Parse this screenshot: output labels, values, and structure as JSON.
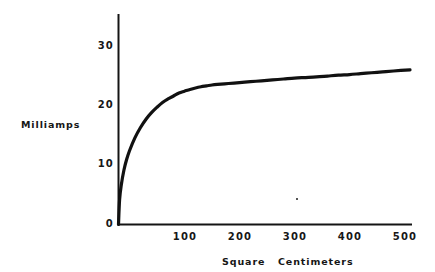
{
  "figure": {
    "background_color": "#ffffff",
    "line_color": "#111111"
  },
  "axes": {
    "y_label": "Milliamps",
    "x_label": "Square   Centimeters",
    "y_ticks": [
      "0",
      "10",
      "20",
      "30"
    ],
    "x_ticks": [
      "100",
      "200",
      "300",
      "400",
      "500"
    ]
  },
  "chart_data": {
    "type": "line",
    "title": "",
    "xlabel": "Square   Centimeters",
    "ylabel": "Milliamps",
    "xlim": [
      0,
      535
    ],
    "ylim": [
      0,
      35
    ],
    "xticks": [
      100,
      200,
      300,
      400,
      500
    ],
    "yticks": [
      0,
      10,
      20,
      30
    ],
    "grid": false,
    "legend": null,
    "series": [
      {
        "name": "current vs area",
        "x": [
          0,
          2,
          5,
          10,
          15,
          20,
          30,
          40,
          50,
          60,
          70,
          80,
          90,
          100,
          110,
          120,
          130,
          140,
          150,
          160,
          170,
          180,
          200,
          220,
          240,
          260,
          280,
          300,
          320,
          340,
          360,
          380,
          400,
          420,
          440,
          460,
          480,
          500,
          530
        ],
        "y": [
          0,
          4.2,
          6.6,
          9.2,
          11.0,
          12.4,
          14.6,
          16.3,
          17.7,
          18.8,
          19.7,
          20.5,
          21.1,
          21.6,
          22.1,
          22.4,
          22.7,
          22.95,
          23.15,
          23.3,
          23.45,
          23.55,
          23.7,
          23.85,
          24.0,
          24.15,
          24.3,
          24.45,
          24.6,
          24.7,
          24.8,
          24.95,
          25.1,
          25.2,
          25.35,
          25.5,
          25.65,
          25.8,
          26.0
        ]
      }
    ]
  }
}
